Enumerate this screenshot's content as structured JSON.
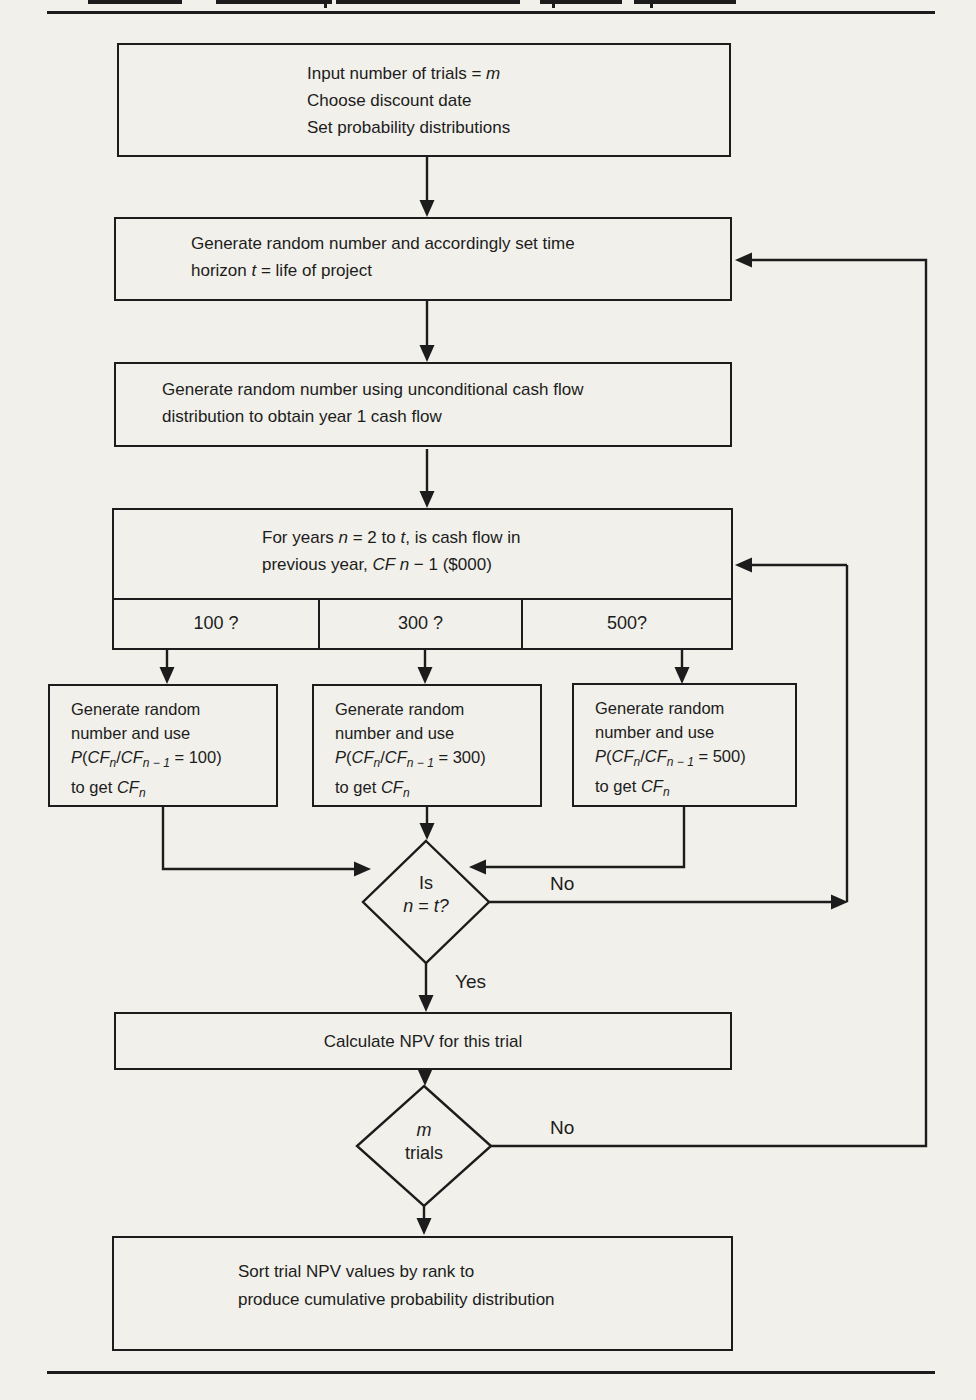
{
  "colors": {
    "paper": "#f1f0ea",
    "ink": "#1c1c1c"
  },
  "flowchart": {
    "start_box": {
      "line1_pre": "Input number of trials = ",
      "line1_var": "m",
      "line2": "Choose discount date",
      "line3": "Set probability distributions"
    },
    "time_horizon_box": {
      "line1": "Generate random number and accordingly set time",
      "line2_pre": "horizon ",
      "line2_var": "t",
      "line2_post": " = life of project"
    },
    "year1_box": {
      "line1": "Generate random number using unconditional cash flow",
      "line2": "distribution to obtain year 1 cash flow"
    },
    "cash_flow_question_box": {
      "line1_pre": "For years ",
      "line1_var1": "n",
      "line1_mid": " = 2 to ",
      "line1_var2": "t",
      "line1_post": ", is cash flow in",
      "line2_pre": "previous year, ",
      "line2_var": "CF n",
      "line2_post": " − 1 ($000)",
      "cells": [
        "100 ?",
        "300 ?",
        "500?"
      ]
    },
    "cf_common": {
      "line1": "Generate random",
      "line2": "number and use",
      "p": "P",
      "open": "(",
      "cf": "CF",
      "sub_n": "n",
      "slash": "/",
      "sub_nm1": "n − 1",
      "eq": " = ",
      "close": ")",
      "to_get": "to get "
    },
    "cf_boxes": [
      {
        "value": "100"
      },
      {
        "value": "300"
      },
      {
        "value": "500"
      }
    ],
    "decision_n": {
      "line1": "Is",
      "var1": "n",
      "eq": " = ",
      "var2": "t?"
    },
    "npv_box": {
      "text": "Calculate NPV for this trial"
    },
    "decision_m": {
      "var": "m",
      "line2": "trials"
    },
    "sort_box": {
      "line1": "Sort trial NPV values by rank to",
      "line2": "produce cumulative probability distribution"
    },
    "labels": {
      "no_n": "No",
      "yes": "Yes",
      "no_m": "No"
    }
  }
}
